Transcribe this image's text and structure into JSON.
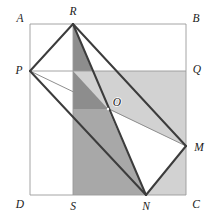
{
  "figure": {
    "type": "geometry-diagram",
    "canvas": {
      "width": 217,
      "height": 219
    },
    "colors": {
      "background": "#ffffff",
      "thin_line": "#9a9a9a",
      "thick_line": "#3c3c3c",
      "label_text": "#1a1a1a",
      "shade_light": "#d2d2d2",
      "shade_medium": "#b4b4b4",
      "shade_dark": "#9a9a9a",
      "shade_darkest": "#868686",
      "white_region": "#ffffff"
    },
    "line_widths": {
      "thin": 0.9,
      "thick": 2.0
    },
    "points": [
      {
        "name": "A",
        "x": 30,
        "y": 24,
        "label": "A",
        "label_x": 20,
        "label_y": 18,
        "on": "square-corner-top-left"
      },
      {
        "name": "B",
        "x": 186,
        "y": 24,
        "label": "B",
        "label_x": 196,
        "label_y": 18,
        "on": "square-corner-top-right"
      },
      {
        "name": "C",
        "x": 186,
        "y": 195,
        "label": "C",
        "label_x": 196,
        "label_y": 205,
        "on": "square-corner-bottom-right"
      },
      {
        "name": "D",
        "x": 30,
        "y": 195,
        "label": "D",
        "label_x": 20,
        "label_y": 205,
        "on": "square-corner-bottom-left"
      },
      {
        "name": "P",
        "x": 30,
        "y": 71,
        "label": "P",
        "label_x": 19,
        "label_y": 71,
        "on": "side-AD"
      },
      {
        "name": "R",
        "x": 73,
        "y": 24,
        "label": "R",
        "label_x": 73,
        "label_y": 12,
        "on": "side-AB"
      },
      {
        "name": "M",
        "x": 186,
        "y": 146,
        "label": "M",
        "label_x": 198,
        "label_y": 148,
        "on": "side-BC"
      },
      {
        "name": "N",
        "x": 146,
        "y": 195,
        "label": "N",
        "label_x": 146,
        "label_y": 207,
        "on": "side-DC"
      },
      {
        "name": "Q",
        "x": 186,
        "y": 71,
        "label": "Q",
        "label_x": 197,
        "label_y": 70,
        "on": "side-BC"
      },
      {
        "name": "S",
        "x": 73,
        "y": 195,
        "label": "S",
        "label_x": 73,
        "label_y": 207,
        "on": "side-DC"
      },
      {
        "name": "O",
        "x": 108,
        "y": 109,
        "label": "O",
        "label_x": 115,
        "label_y": 104,
        "on": "rectangle-center"
      }
    ],
    "segments": [
      {
        "name": "square-side-AB",
        "from": "A",
        "to": "B",
        "weight": "thin"
      },
      {
        "name": "square-side-BC",
        "from": "B",
        "to": "C",
        "weight": "thin"
      },
      {
        "name": "square-side-CD",
        "from": "C",
        "to": "D",
        "weight": "thin"
      },
      {
        "name": "square-side-DA",
        "from": "D",
        "to": "A",
        "weight": "thin"
      },
      {
        "name": "line-PQ",
        "from": "P",
        "to": "Q",
        "weight": "thin"
      },
      {
        "name": "line-RS",
        "from": "R",
        "to": "S",
        "weight": "thin"
      },
      {
        "name": "rect-side-PR",
        "from": "P",
        "to": "R",
        "weight": "thick"
      },
      {
        "name": "rect-side-RM",
        "from": "R",
        "to": "M",
        "weight": "thick"
      },
      {
        "name": "rect-side-MN",
        "from": "M",
        "to": "N",
        "weight": "thick"
      },
      {
        "name": "rect-side-NP",
        "from": "N",
        "to": "P",
        "weight": "thick"
      },
      {
        "name": "diagonal-RN",
        "from": "R",
        "to": "N",
        "weight": "thick"
      },
      {
        "name": "diagonal-PM",
        "from": "P",
        "to": "M",
        "weight": "thin"
      }
    ],
    "regions": [
      {
        "name": "band-PQCD-right-lower",
        "tone": "shade_light",
        "desc": "horizontal band below PQ"
      },
      {
        "name": "band-RSNB-vertical",
        "tone": "shade_medium",
        "desc": "vertical band right of RS"
      },
      {
        "name": "triangle-PRN-shade",
        "tone": "shade_dark",
        "desc": "triangle region P-R-N"
      },
      {
        "name": "overlap-core",
        "tone": "shade_darkest",
        "desc": "triple overlap near O"
      },
      {
        "name": "triangle-PNM-white",
        "tone": "white_region",
        "desc": "white triangle P-N-M"
      }
    ],
    "labels": {
      "A": "A",
      "B": "B",
      "C": "C",
      "D": "D",
      "P": "P",
      "Q": "Q",
      "R": "R",
      "S": "S",
      "M": "M",
      "N": "N",
      "O": "O"
    }
  }
}
